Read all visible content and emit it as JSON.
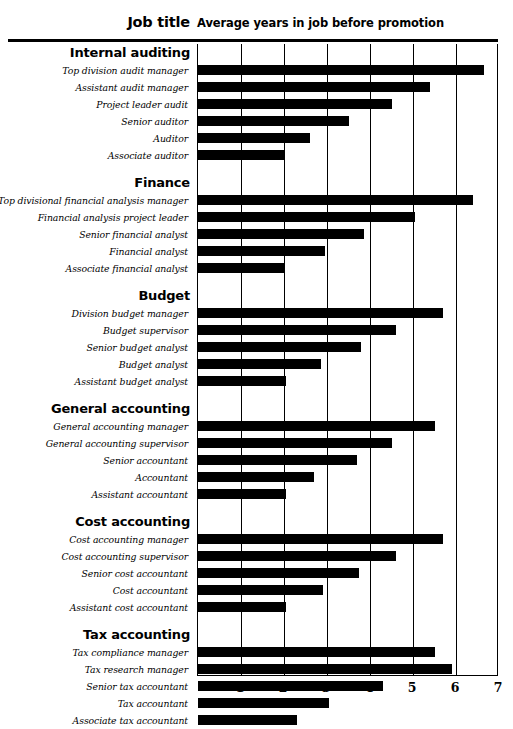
{
  "header": {
    "job_title_label": "Job title",
    "axis_title": "Average years in job before promotion"
  },
  "chart_data": {
    "type": "bar",
    "orientation": "horizontal",
    "title": "Average years in job before promotion",
    "xlabel": "Average years in job before promotion",
    "ylabel": "Job title",
    "xlim": [
      0,
      7
    ],
    "xticks": [
      "1",
      "2",
      "3",
      "4",
      "5",
      "6",
      "7"
    ],
    "grid": true,
    "legend": "none",
    "groups": [
      {
        "name": "Internal auditing",
        "categories": [
          "Top division audit manager",
          "Assistant audit manager",
          "Project leader audit",
          "Senior auditor",
          "Auditor",
          "Associate auditor"
        ],
        "values": [
          6.65,
          5.4,
          4.5,
          3.5,
          2.6,
          2.0
        ]
      },
      {
        "name": "Finance",
        "categories": [
          "Top divisional financial analysis manager",
          "Financial analysis project leader",
          "Senior financial analyst",
          "Financial analyst",
          "Associate financial analyst"
        ],
        "values": [
          6.4,
          5.05,
          3.85,
          2.95,
          2.0
        ]
      },
      {
        "name": "Budget",
        "categories": [
          "Division budget manager",
          "Budget supervisor",
          "Senior budget analyst",
          "Budget analyst",
          "Assistant budget analyst"
        ],
        "values": [
          5.7,
          4.6,
          3.8,
          2.85,
          2.05
        ]
      },
      {
        "name": "General accounting",
        "categories": [
          "General accounting manager",
          "General accounting supervisor",
          "Senior accountant",
          "Accountant",
          "Assistant accountant"
        ],
        "values": [
          5.5,
          4.5,
          3.7,
          2.7,
          2.05
        ]
      },
      {
        "name": "Cost accounting",
        "categories": [
          "Cost accounting manager",
          "Cost accounting supervisor",
          "Senior cost accountant",
          "Cost accountant",
          "Assistant cost accountant"
        ],
        "values": [
          5.7,
          4.6,
          3.75,
          2.9,
          2.05
        ]
      },
      {
        "name": "Tax accounting",
        "categories": [
          "Tax compliance manager",
          "Tax research manager",
          "Senior tax accountant",
          "Tax accountant",
          "Associate tax accountant"
        ],
        "values": [
          5.5,
          5.9,
          4.3,
          3.05,
          2.3
        ]
      }
    ]
  },
  "colors": {
    "bar": "#000000",
    "axis": "#000000",
    "background": "#ffffff"
  }
}
